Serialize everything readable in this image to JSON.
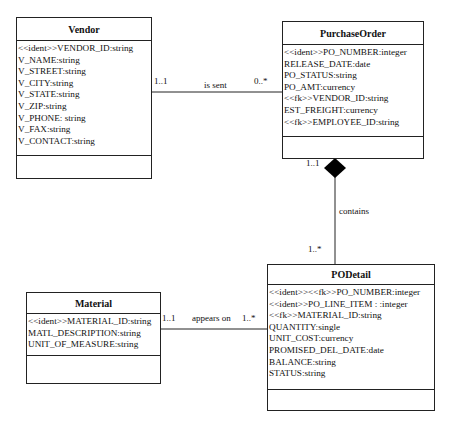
{
  "classes": {
    "vendor": {
      "name": "Vendor",
      "attributes": [
        "<<ident>>VENDOR_ID:string",
        "V_NAME:string",
        "V_STREET:string",
        "V_CITY:string",
        "V_STATE:string",
        "V_ZIP:string",
        "V_PHONE: string",
        "V_FAX:string",
        "V_CONTACT:string"
      ]
    },
    "purchase_order": {
      "name": "PurchaseOrder",
      "attributes": [
        "<<ident>>PO_NUMBER:integer",
        "RELEASE_DATE:date",
        "PO_STATUS:string",
        "PO_AMT:currency",
        "<<fk>>VENDOR_ID:string",
        "EST_FREIGHT:currency",
        "<<fk>>EMPLOYEE_ID:string"
      ]
    },
    "po_detail": {
      "name": "PODetail",
      "attributes": [
        "<<ident>><<fk>>PO_NUMBER:integer",
        "<<ident>>PO_LINE_ITEM : :integer",
        "<<fk>>MATERIAL_ID:string",
        "QUANTITY:single",
        "UNIT_COST:currency",
        "PROMISED_DEL_DATE:date",
        "BALANCE:string",
        "STATUS:string"
      ]
    },
    "material": {
      "name": "Material",
      "attributes": [
        "<<ident>>MATERIAL_ID:string",
        "MATL_DESCRIPTION:string",
        "UNIT_OF_MEASURE:string"
      ]
    }
  },
  "associations": {
    "is_sent": {
      "label": "is sent",
      "from_mult": "1..1",
      "to_mult": "0..*"
    },
    "contains": {
      "label": "contains",
      "from_mult": "1..1",
      "to_mult": "1..*"
    },
    "appears_on": {
      "label": "appears on",
      "from_mult": "1..1",
      "to_mult": "1..*"
    }
  }
}
